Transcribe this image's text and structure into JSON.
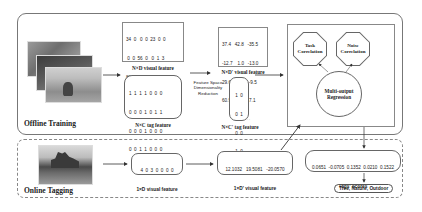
{
  "offline_training": {
    "label": "Offline Training",
    "visual_matrix": {
      "rows": [
        "34  0   0  0  23  0  0",
        " 0  0  56  0   0  1  3",
        "82  0   0  0   0  0  0",
        " 0  0  12  0   0 45  0"
      ],
      "ellipsis": "··· ···",
      "caption": "N×D visual feature"
    },
    "tag_matrix": {
      "rows": [
        "1  1  1  1  0  0  0",
        "0  0  0  1  0  1  1",
        "0  0  0  1  0  0  0",
        "0  0  1  1  0  0  0"
      ],
      "ellipsis": "··· ···",
      "caption": "N×C tag feature"
    },
    "reduction_label": "Feature Space\nDimensionality\nReduction",
    "reduced_visual_matrix": {
      "rows": [
        "37.4   42.8   -35.5",
        "-12.7    1.0   -13.0",
        "29.6   34.0    -9.5",
        "60.9   -7.4     7.1"
      ],
      "ellipsis": "··· ···",
      "caption": "N×D' visual feature"
    },
    "reduced_tag_matrix": {
      "rows": [
        "1  0",
        "0  1",
        "0  0",
        "1  0"
      ],
      "ellipsis": "··· ···",
      "caption": "N×C' tag feature"
    },
    "model": {
      "task_correlation": "Task\nCorrelation",
      "noise_correlation": "Noise\nCorrelation",
      "regression": "Multi-output\nRegression"
    }
  },
  "online_tagging": {
    "label": "Online Tagging",
    "visual_vector": {
      "values": "4  0  3  0  0  0  0",
      "caption": "1×D  visual feature"
    },
    "reduced_vector": {
      "values": "12.1032   19.5081   -20.0570",
      "caption": "1×D'  visual feature"
    },
    "tag_scores": {
      "values": "0.0651  -0.0705  0.1352  0.0210  0.1522",
      "caption": "Tags' scores"
    },
    "result": "Tree, Nature, Outdoor"
  }
}
